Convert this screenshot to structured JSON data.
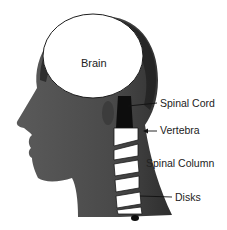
{
  "diagram": {
    "labels": {
      "brain": "Brain",
      "spinal_cord": "Spinal Cord",
      "vertebra": "Vertebra",
      "spinal_column": "Spinal Column",
      "disks": "Disks"
    },
    "colors": {
      "head": "#4a4a4a",
      "head_outline": "#1e1e1e",
      "brain": "#ffffff",
      "spinal_cord": "#0d0d0d",
      "vertebra": "#ffffff",
      "text": "#222222"
    }
  }
}
